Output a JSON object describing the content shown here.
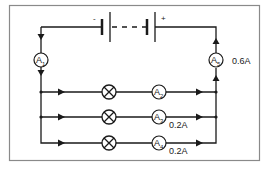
{
  "diagram": {
    "type": "circuit",
    "battery": {
      "negative_label": "-",
      "positive_label": "+"
    },
    "ammeters": [
      {
        "id": "A1",
        "letter": "A",
        "subscript": "1",
        "reading": ""
      },
      {
        "id": "A2",
        "letter": "A",
        "subscript": "2",
        "reading": ""
      },
      {
        "id": "A3",
        "letter": "A",
        "subscript": "3",
        "reading": "0.2A"
      },
      {
        "id": "A4",
        "letter": "A",
        "subscript": "4",
        "reading": "0.2A"
      },
      {
        "id": "A5",
        "letter": "A",
        "subscript": "5",
        "reading": "0.6A"
      }
    ],
    "lamps": [
      {
        "branch": 1
      },
      {
        "branch": 2
      },
      {
        "branch": 3
      }
    ],
    "colors": {
      "wire": "#1a1a1a",
      "frame": "#8a8a8a",
      "background": "#ffffff"
    }
  }
}
